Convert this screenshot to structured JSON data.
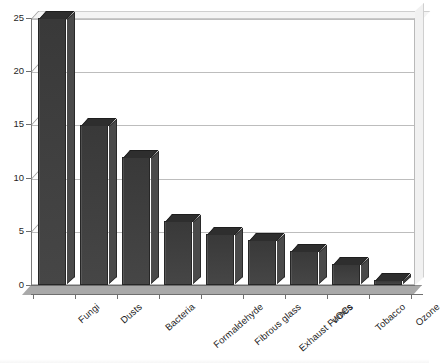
{
  "chart_data": {
    "type": "bar",
    "title": "",
    "subtitle": "",
    "xlabel": "",
    "ylabel": "",
    "ylim": [
      0,
      25
    ],
    "yticks": [
      0,
      5,
      10,
      15,
      20,
      25
    ],
    "grid": true,
    "legend": false,
    "legend_position": "none",
    "style": "3d-column-grayscale-scan",
    "categories": [
      "Fungi",
      "Dusts",
      "Bacteria",
      "Formaldehyde",
      "Fibrous glass",
      "Exhaust Fumes",
      "VOCs",
      "Tobacco",
      "Ozone"
    ],
    "values": [
      25,
      15,
      12,
      6,
      4.8,
      4.2,
      3.2,
      2,
      0.5
    ],
    "series": [
      {
        "name": "",
        "values": [
          25,
          15,
          12,
          6,
          4.8,
          4.2,
          3.2,
          2,
          0.5
        ]
      }
    ]
  },
  "colors": {
    "bar_front": "#3c3c3c",
    "bar_top": "#2e2e2e",
    "bar_side": "#4a4a4a",
    "gridline": "#bdbdbd",
    "axis": "#6f6f6f",
    "floor": "#a9a9a9",
    "plot_background": "#ffffff",
    "text": "#1c1c1c"
  },
  "axes": {
    "y_tick_labels": [
      "25",
      "20",
      "15",
      "10",
      "5",
      "0"
    ]
  }
}
